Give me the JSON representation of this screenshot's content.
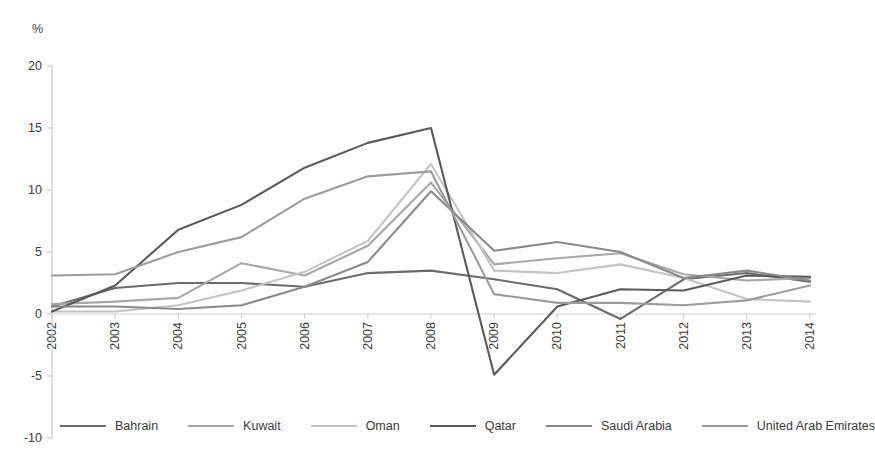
{
  "chart_data": {
    "type": "line",
    "title": "",
    "subtitle": "",
    "xlabel": "",
    "ylabel": "%",
    "unit_label": "%",
    "grid": false,
    "legend_position": "bottom",
    "xlim": [
      2002,
      2014
    ],
    "ylim": [
      -10,
      20
    ],
    "y_ticks": [
      20,
      15,
      10,
      5,
      0,
      -5,
      -10
    ],
    "x_ticks": [
      "2002",
      "2003",
      "2004",
      "2005",
      "2006",
      "2007",
      "2008",
      "2009",
      "2010",
      "2011",
      "2012",
      "2013",
      "2014"
    ],
    "categories": [
      2002,
      2003,
      2004,
      2005,
      2006,
      2007,
      2008,
      2009,
      2010,
      2011,
      2012,
      2013,
      2014
    ],
    "series": [
      {
        "name": "Bahrain",
        "color": "#6b6b6b",
        "values": [
          0.6,
          2.1,
          2.5,
          2.5,
          2.2,
          3.3,
          3.5,
          2.8,
          2.0,
          -0.4,
          2.8,
          3.3,
          2.6
        ]
      },
      {
        "name": "Kuwait",
        "color": "#a8a8a8",
        "values": [
          0.8,
          1.0,
          1.3,
          4.1,
          3.1,
          5.5,
          10.6,
          4.0,
          4.5,
          4.9,
          3.2,
          2.7,
          2.9
        ]
      },
      {
        "name": "Oman",
        "color": "#c4c4c4",
        "values": [
          0.2,
          0.2,
          0.7,
          1.9,
          3.4,
          5.9,
          12.1,
          3.5,
          3.3,
          4.0,
          2.9,
          1.2,
          1.0
        ]
      },
      {
        "name": "Qatar",
        "color": "#5a5a5a",
        "values": [
          0.2,
          2.3,
          6.8,
          8.8,
          11.8,
          13.8,
          15.0,
          -4.9,
          0.6,
          2.0,
          1.9,
          3.1,
          3.0
        ]
      },
      {
        "name": "Saudi Arabia",
        "color": "#8a8a8a",
        "values": [
          0.6,
          0.6,
          0.4,
          0.7,
          2.2,
          4.2,
          9.9,
          5.1,
          5.8,
          5.0,
          2.9,
          3.5,
          2.7
        ]
      },
      {
        "name": "United Arab Emirates",
        "color": "#9c9c9c",
        "values": [
          3.1,
          3.2,
          5.0,
          6.2,
          9.3,
          11.1,
          11.5,
          1.6,
          0.9,
          0.9,
          0.7,
          1.1,
          2.3
        ]
      }
    ]
  },
  "legend": {
    "items": [
      {
        "label": "Bahrain"
      },
      {
        "label": "Kuwait"
      },
      {
        "label": "Oman"
      },
      {
        "label": "Qatar"
      },
      {
        "label": "Saudi Arabia"
      },
      {
        "label": "United Arab Emirates"
      }
    ]
  }
}
